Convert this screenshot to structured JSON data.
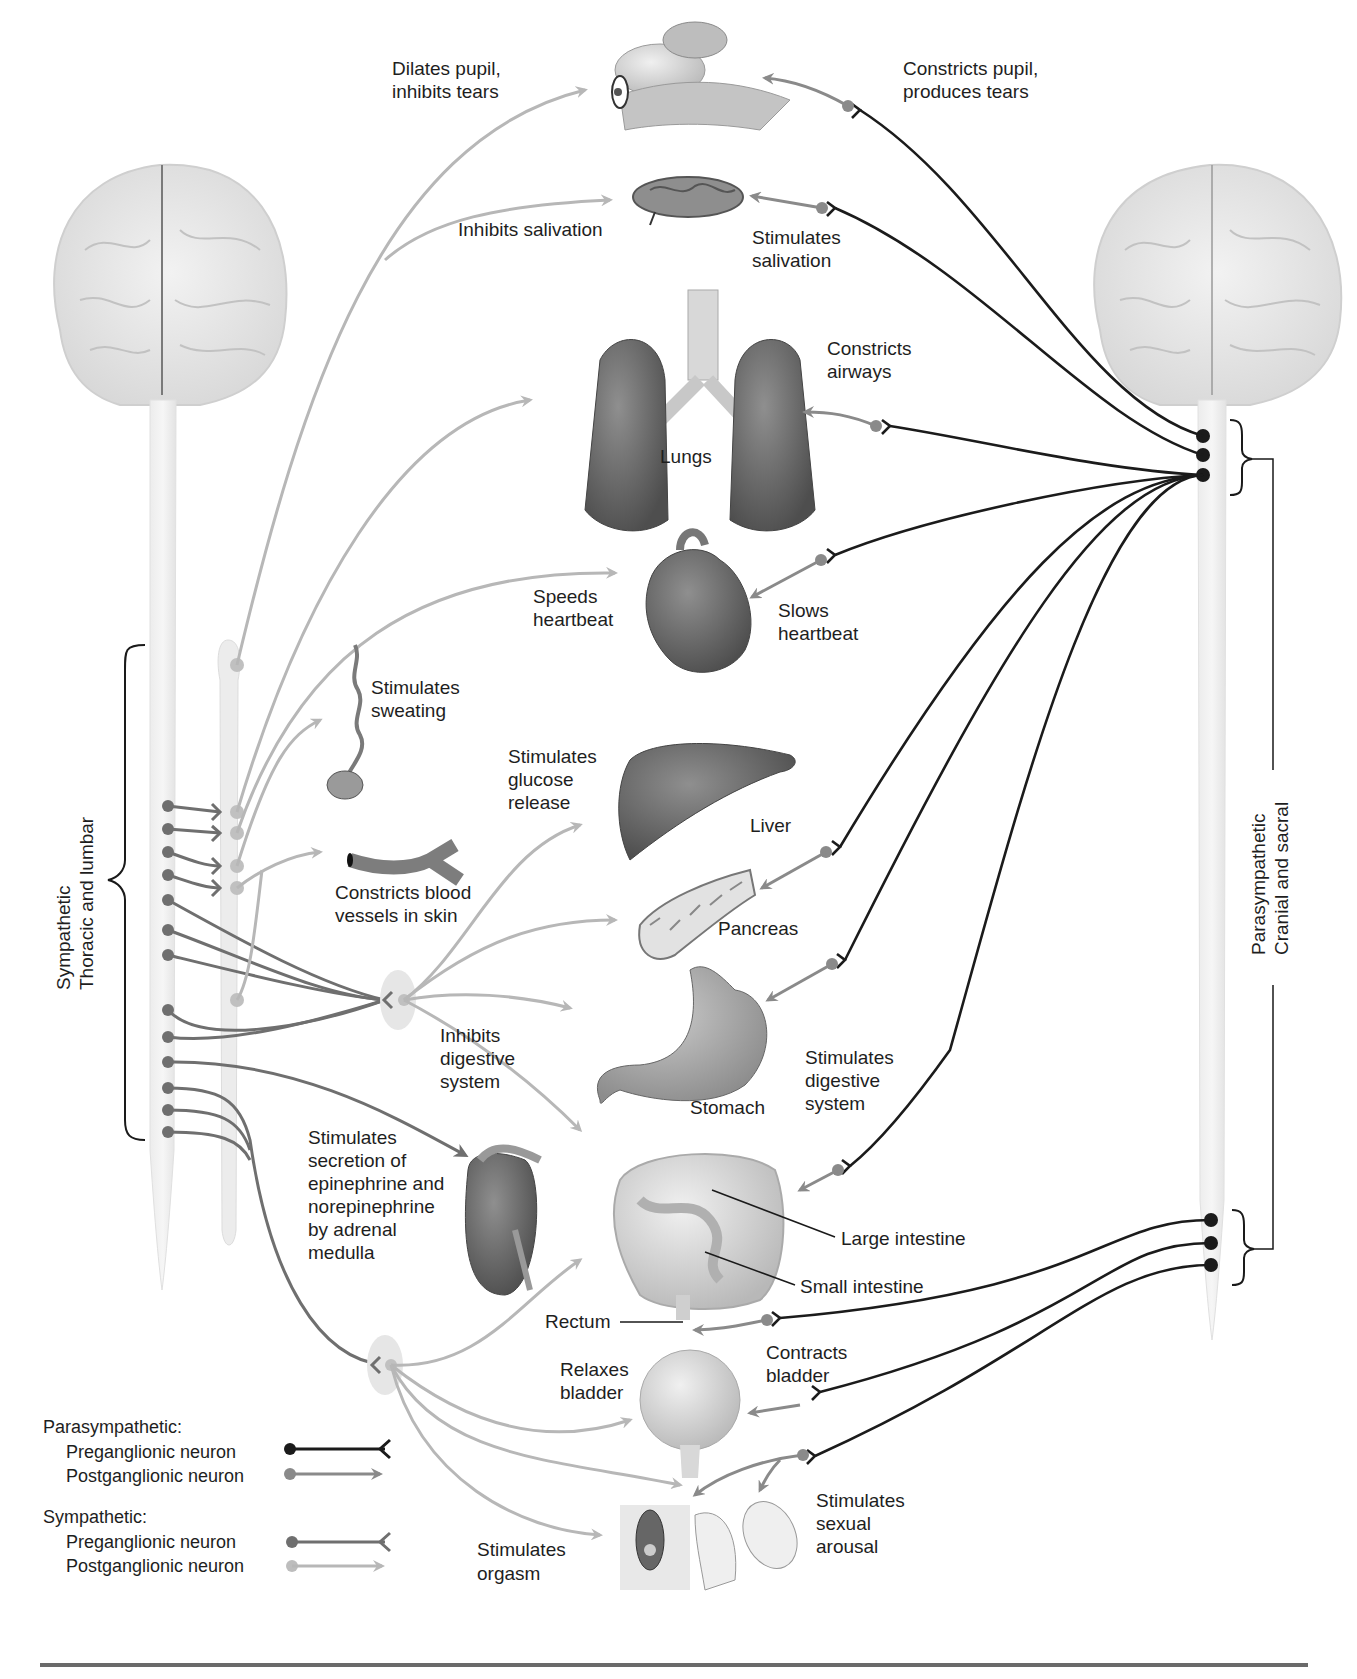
{
  "diagram": {
    "title_region": "Autonomic nervous system: sympathetic and parasympathetic divisions",
    "left_division": {
      "line1": "Sympathetic",
      "line2": "Thoracic and lumbar"
    },
    "right_division": {
      "line1": "Parasympathetic",
      "line2": "Cranial and sacral"
    },
    "organs": {
      "eye": {
        "sympathetic": [
          "Dilates pupil,",
          "inhibits tears"
        ],
        "parasympathetic": [
          "Constricts pupil,",
          "produces tears"
        ]
      },
      "salivary": {
        "sympathetic": [
          "Inhibits salivation"
        ],
        "parasympathetic": [
          "Stimulates",
          "salivation"
        ]
      },
      "lungs": {
        "name": "Lungs",
        "parasympathetic": [
          "Constricts",
          "airways"
        ]
      },
      "heart": {
        "sympathetic": [
          "Speeds",
          "heartbeat"
        ],
        "parasympathetic": [
          "Slows",
          "heartbeat"
        ]
      },
      "sweat_gland": {
        "sympathetic": [
          "Stimulates",
          "sweating"
        ]
      },
      "blood_vessels": {
        "sympathetic": [
          "Constricts blood",
          "vessels in skin"
        ]
      },
      "liver": {
        "name": "Liver",
        "sympathetic": [
          "Stimulates",
          "glucose",
          "release"
        ]
      },
      "pancreas": {
        "name": "Pancreas"
      },
      "stomach": {
        "name": "Stomach",
        "sympathetic": [
          "Inhibits",
          "digestive",
          "system"
        ],
        "parasympathetic": [
          "Stimulates",
          "digestive",
          "system"
        ]
      },
      "adrenal": {
        "sympathetic": [
          "Stimulates",
          "secretion of",
          "epinephrine and",
          "norepinephrine",
          "by adrenal",
          "medulla"
        ]
      },
      "intestines": {
        "large": "Large intestine",
        "small": "Small intestine",
        "rectum": "Rectum"
      },
      "bladder": {
        "sympathetic": [
          "Relaxes",
          "bladder"
        ],
        "parasympathetic": [
          "Contracts",
          "bladder"
        ]
      },
      "genitals": {
        "sympathetic": [
          "Stimulates",
          "orgasm"
        ],
        "parasympathetic": [
          "Stimulates",
          "sexual",
          "arousal"
        ]
      }
    },
    "legend": {
      "parasympathetic_title": "Parasympathetic:",
      "parasympathetic_pre": "Preganglionic neuron",
      "parasympathetic_post": "Postganglionic neuron",
      "sympathetic_title": "Sympathetic:",
      "sympathetic_pre": "Preganglionic neuron",
      "sympathetic_post": "Postganglionic neuron"
    },
    "colors": {
      "parasympathetic_pre": "#1b1b1b",
      "parasympathetic_post": "#8a8a8a",
      "sympathetic_pre": "#6f6f6f",
      "sympathetic_post": "#b7b7b7",
      "brain": "#e6e6e6"
    }
  }
}
